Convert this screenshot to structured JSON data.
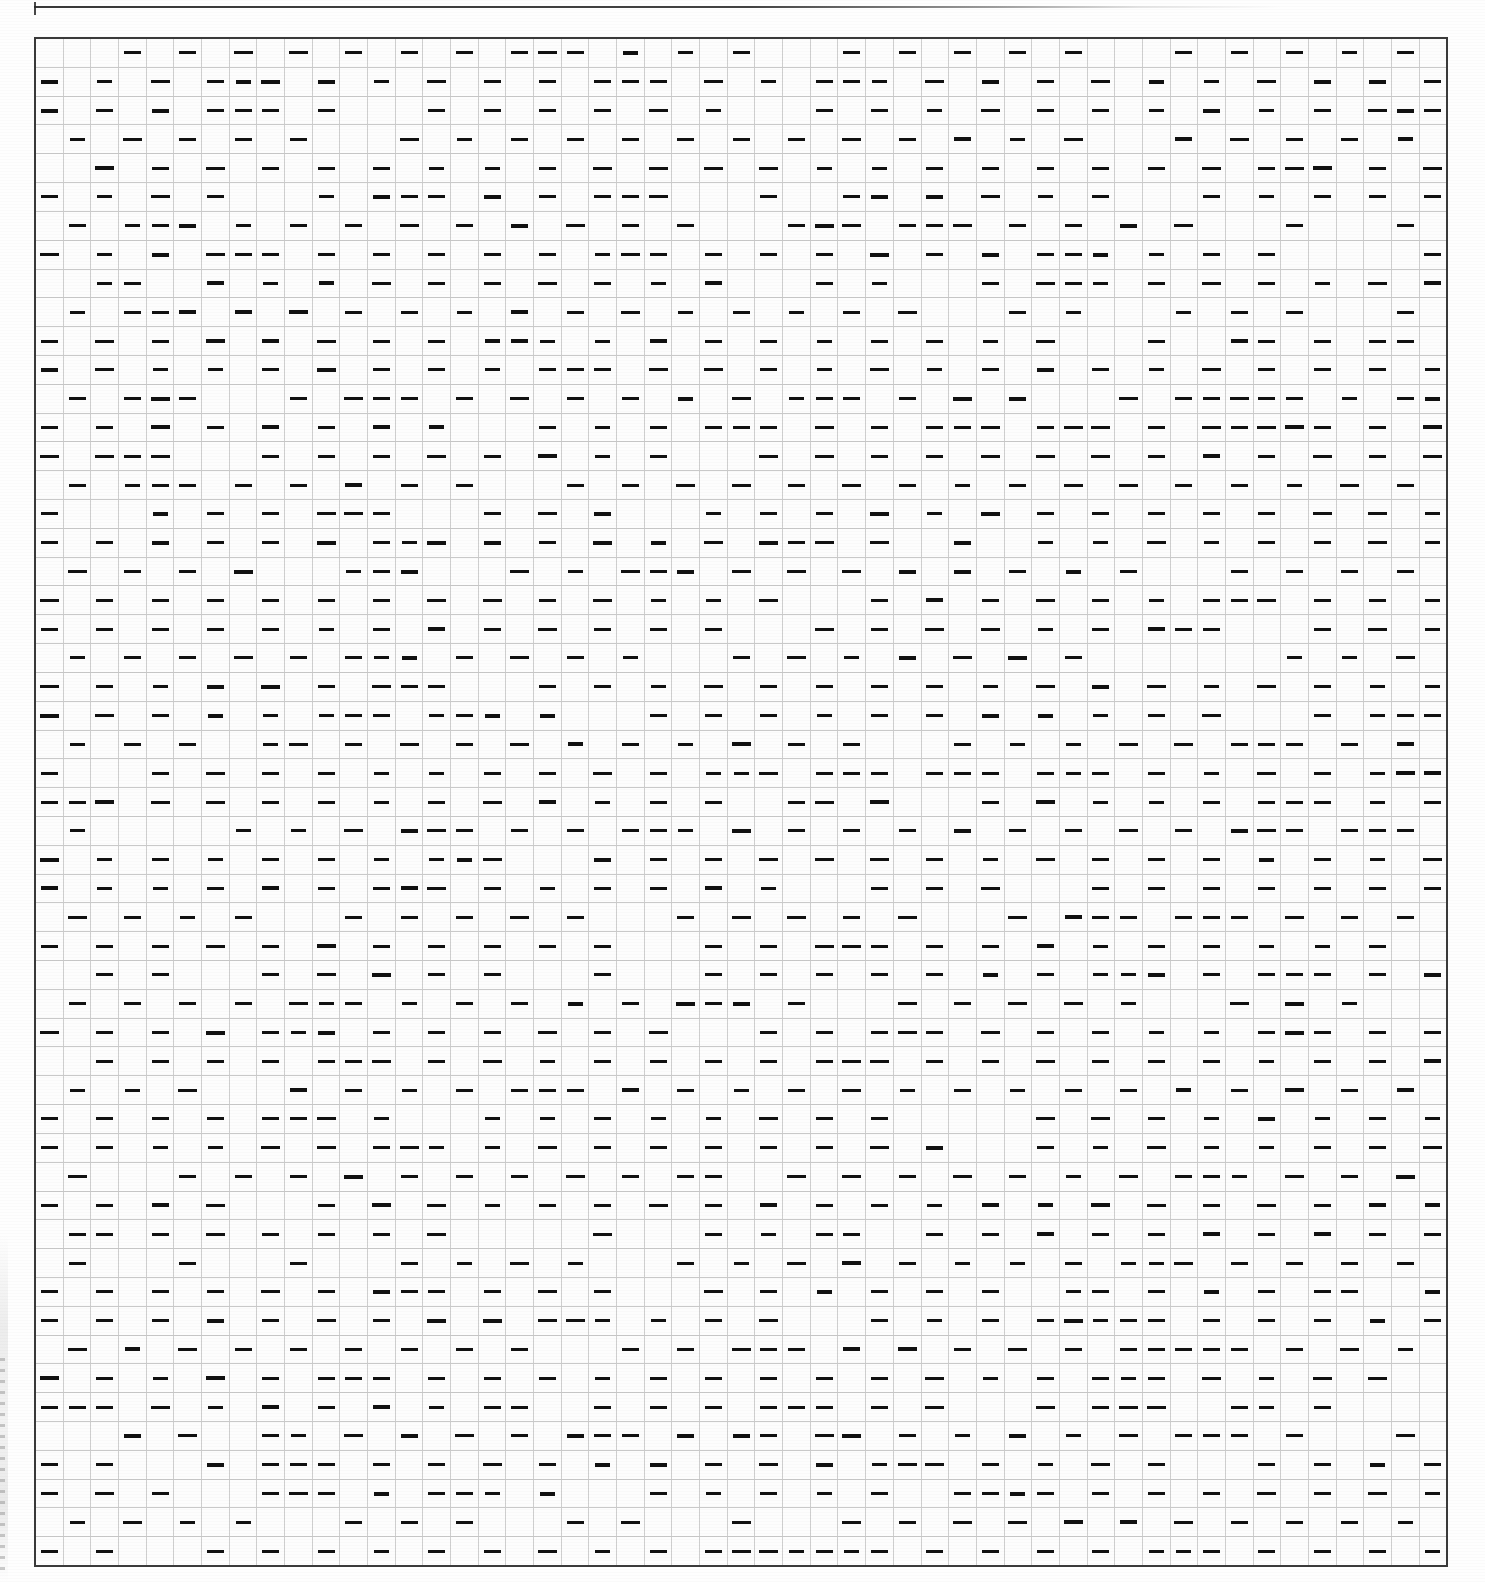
{
  "document": {
    "kind": "scanned-tabular-sheet",
    "page_background": "#fefefe",
    "ink_color": "#111111",
    "grid_line_color": "#cfcfcf",
    "border_color": "#3a3a3a"
  },
  "upper_table_fragment": {
    "description": "bottom rule of the preceding table, cropped at the top of the page",
    "visible": true
  },
  "grid": {
    "columns": 51,
    "rows": 53,
    "cell_mark": "—",
    "mark_name": "em-dash",
    "left": 34,
    "top": 37,
    "width": 1414,
    "height": 1530,
    "pattern_note": "marks alternate between odd and even columns on alternating row pairs"
  },
  "chart_data": {
    "type": "table",
    "title": "",
    "columns": 51,
    "rows": 53,
    "legend": [],
    "cells_note": "Each occupied cell contains a single em-dash glyph; blanks are empty.",
    "row_offsets": [
      1,
      0,
      0,
      1,
      0,
      0,
      1,
      0,
      0,
      1,
      0,
      0,
      1,
      0,
      0,
      1,
      0,
      0,
      1,
      0,
      0,
      1,
      0,
      0,
      1,
      0,
      0,
      1,
      0,
      0,
      1,
      0,
      0,
      1,
      0,
      0,
      1,
      0,
      0,
      1,
      0,
      0,
      1,
      0,
      0,
      1,
      0,
      0,
      1,
      0,
      0,
      1,
      0
    ]
  }
}
